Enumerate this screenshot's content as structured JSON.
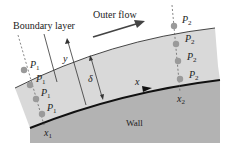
{
  "diagram": {
    "labels": {
      "boundary_layer": "Boundary layer",
      "outer_flow": "Outer flow",
      "wall": "Wall",
      "y": "y",
      "x": "x",
      "delta": "δ",
      "x1_main": "x",
      "x1_sub": "1",
      "x2_main": "x",
      "x2_sub": "2"
    },
    "points_left": [
      {
        "main": "P",
        "sub": "1"
      },
      {
        "main": "P",
        "sub": "1"
      },
      {
        "main": "P",
        "sub": "1"
      },
      {
        "main": "P",
        "sub": "1"
      }
    ],
    "points_right": [
      {
        "main": "P",
        "sub": "2"
      },
      {
        "main": "P",
        "sub": "2"
      },
      {
        "main": "P",
        "sub": "2"
      },
      {
        "main": "P",
        "sub": "2"
      }
    ],
    "colors": {
      "boundary_layer_fill": "#d9d9d9",
      "wall_fill": "#b3b3b3",
      "point_fill": "#9a9a9a",
      "line": "#333333"
    }
  }
}
